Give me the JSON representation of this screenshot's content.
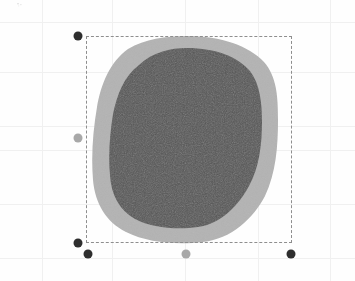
{
  "canvas": {
    "width": 355,
    "height": 281,
    "background_color": "#fefefe",
    "grid": {
      "enabled": true,
      "line_color": "#f0f0f0",
      "cell_size": 50,
      "label": "graph-paper-grid"
    },
    "artifact_label": "scan-speck"
  },
  "shape": {
    "name": "Filled circle with halo ring",
    "outer": {
      "label": "outer-ring",
      "fill_color": "#b3b3b3",
      "center_x": 185,
      "center_y": 139,
      "radius_x": 93,
      "radius_y": 104,
      "bounds": {
        "left": 93,
        "top": 36,
        "right": 278,
        "bottom": 243
      }
    },
    "inner": {
      "label": "inner-disc",
      "fill_color": "#555555",
      "texture": "noise",
      "center_x": 186,
      "center_y": 138,
      "radius_x": 76,
      "radius_y": 90,
      "bounds": {
        "left": 110,
        "top": 48,
        "right": 262,
        "bottom": 228
      }
    }
  },
  "selection": {
    "label": "selection-bounding-box",
    "stroke_color": "#8e8e8e",
    "stroke_style": "dashed",
    "x": 86,
    "y": 36,
    "width": 206,
    "height": 207,
    "handles": [
      {
        "name": "handle-top-left",
        "x": 78,
        "y": 36,
        "state": "active"
      },
      {
        "name": "handle-middle-left",
        "x": 78,
        "y": 138,
        "state": "inactive"
      },
      {
        "name": "handle-bottom-left",
        "x": 78,
        "y": 243,
        "state": "active"
      },
      {
        "name": "handle-bottom-offset",
        "x": 88,
        "y": 254,
        "state": "active"
      },
      {
        "name": "handle-bottom-center",
        "x": 186,
        "y": 254,
        "state": "inactive"
      },
      {
        "name": "handle-bottom-right",
        "x": 291,
        "y": 254,
        "state": "active"
      }
    ]
  },
  "colors": {
    "handle_active": "#2e2e2e",
    "handle_inactive": "#a8a8a8",
    "ring": "#b3b3b3",
    "disc": "#555555",
    "grid": "#f0f0f0",
    "selection_stroke": "#8e8e8e"
  }
}
